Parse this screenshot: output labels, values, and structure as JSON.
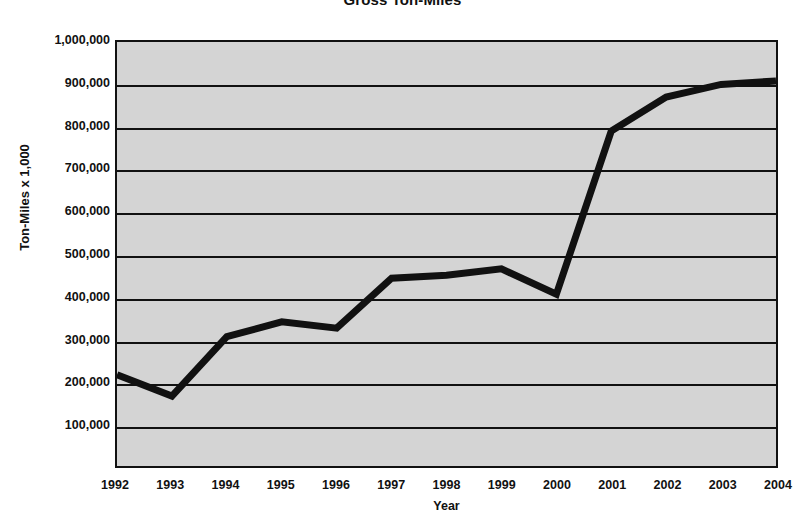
{
  "chart_data": {
    "type": "line",
    "title": "Gross Ton-Miles",
    "xlabel": "Year",
    "ylabel": "Ton-Miles x 1,000",
    "grid": true,
    "legend": false,
    "xlim": [
      1992,
      2004
    ],
    "ylim": [
      0,
      1000000
    ],
    "y_ticks": [
      1000000,
      900000,
      800000,
      700000,
      600000,
      500000,
      400000,
      300000,
      200000,
      100000
    ],
    "y_tick_labels": [
      "1,000,000",
      "900,000",
      "800,000",
      "700,000",
      "600,000",
      "500,000",
      "400,000",
      "300,000",
      "200,000",
      "100,000"
    ],
    "categories": [
      1992,
      1993,
      1994,
      1995,
      1996,
      1997,
      1998,
      1999,
      2000,
      2001,
      2002,
      2003,
      2004
    ],
    "x_tick_labels": [
      "1992",
      "1993",
      "1994",
      "1995",
      "1996",
      "1997",
      "1998",
      "1999",
      "2000",
      "2001",
      "2002",
      "2003",
      "2004"
    ],
    "values": [
      215000,
      165000,
      305000,
      340000,
      325000,
      443000,
      450000,
      465000,
      405000,
      790000,
      870000,
      900000,
      908000
    ],
    "series_color": "#111111",
    "plot_background": "#d4d4d4",
    "grid_color": "#111111"
  }
}
